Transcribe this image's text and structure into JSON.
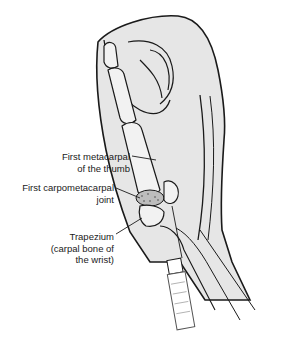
{
  "figure": {
    "clipped_title": "",
    "labels": [
      {
        "id": "metacarpal",
        "lines": [
          "First metacarpal",
          "of the thumb"
        ]
      },
      {
        "id": "cmc-joint",
        "lines": [
          "First carpometacarpal",
          "joint"
        ]
      },
      {
        "id": "trapezium",
        "lines": [
          "Trapezium",
          "(carpal bone of",
          "the wrist)"
        ]
      }
    ],
    "colors": {
      "skin_fill": "#e6e6e6",
      "bone_fill": "#f2f2f2",
      "outline": "#1a1a1a",
      "joint_speckle": "#8a8a8a"
    }
  }
}
